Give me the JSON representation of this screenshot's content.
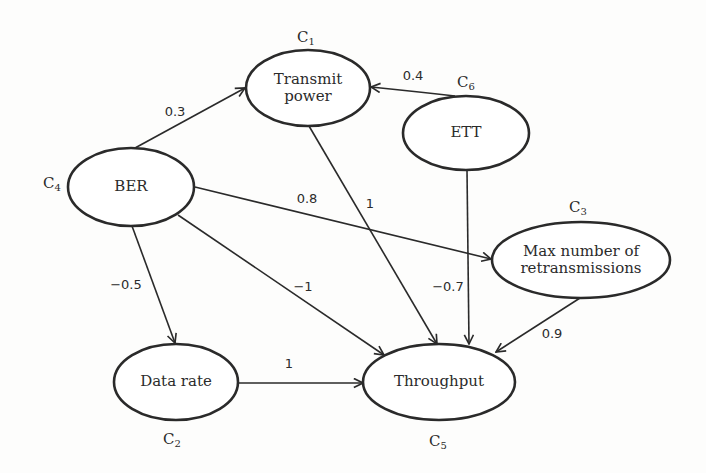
{
  "diagram": {
    "type": "fuzzy-cognitive-map",
    "colors": {
      "stroke": "#2a2a2a",
      "text": "#2b2b2b",
      "background": "#fdfdfc"
    },
    "nodes": [
      {
        "id": "C1",
        "id_letter": "C",
        "id_sub": "1",
        "label_line1": "Transmit",
        "label_line2": "power"
      },
      {
        "id": "C2",
        "id_letter": "C",
        "id_sub": "2",
        "label": "Data rate"
      },
      {
        "id": "C3",
        "id_letter": "C",
        "id_sub": "3",
        "label_line1": "Max number of",
        "label_line2": "retransmissions"
      },
      {
        "id": "C4",
        "id_letter": "C",
        "id_sub": "4",
        "label": "BER"
      },
      {
        "id": "C5",
        "id_letter": "C",
        "id_sub": "5",
        "label": "Throughput"
      },
      {
        "id": "C6",
        "id_letter": "C",
        "id_sub": "6",
        "label": "ETT"
      }
    ],
    "edges": [
      {
        "from": "C4",
        "to": "C1",
        "weight": "0.3"
      },
      {
        "from": "C6",
        "to": "C1",
        "weight": "0.4"
      },
      {
        "from": "C4",
        "to": "C3",
        "weight": "0.8"
      },
      {
        "from": "C1",
        "to": "C5",
        "weight": "1"
      },
      {
        "from": "C4",
        "to": "C2",
        "weight": "−0.5"
      },
      {
        "from": "C4",
        "to": "C5",
        "weight": "−1"
      },
      {
        "from": "C6",
        "to": "C5",
        "weight": "−0.7"
      },
      {
        "from": "C3",
        "to": "C5",
        "weight": "0.9"
      },
      {
        "from": "C2",
        "to": "C5",
        "weight": "1"
      }
    ]
  }
}
